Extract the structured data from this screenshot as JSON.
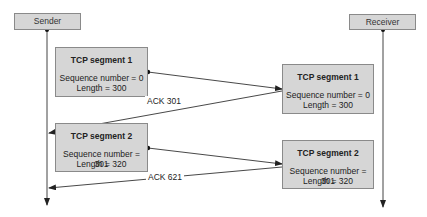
{
  "actors": {
    "sender": {
      "label": "Sender"
    },
    "receiver": {
      "label": "Receiver"
    }
  },
  "segments": [
    {
      "sent": {
        "title": "TCP segment 1",
        "sequence": "Sequence number = 0",
        "length": "Length = 300"
      },
      "received": {
        "title": "TCP segment 1",
        "sequence": "Sequence number = 0",
        "length": "Length = 300"
      },
      "ack": "ACK 301"
    },
    {
      "sent": {
        "title": "TCP segment 2",
        "sequence": "Sequence number = 301",
        "length": "Length = 320"
      },
      "received": {
        "title": "TCP segment 2",
        "sequence": "Sequence number = 301",
        "length": "Length = 320"
      },
      "ack": "ACK 621"
    }
  ],
  "colors": {
    "box_fill": "#d6d6d6",
    "box_border": "#8a8a8a",
    "line": "#333333"
  }
}
